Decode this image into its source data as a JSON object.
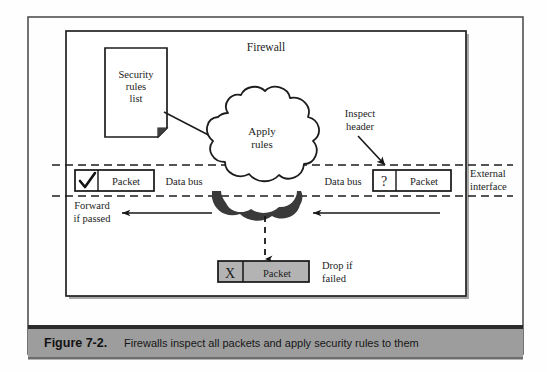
{
  "figure": {
    "number": "Figure 7-2.",
    "caption": "Firewalls inspect all packets and apply security rules to them",
    "caption_bar_color": "#9d9d9d",
    "caption_bar_top_rule_color": "#2b2b2b"
  },
  "diagram": {
    "outer_frame_color": "#4a4a4a",
    "inner_box_label": "Firewall",
    "inner_box_border_color": "#2a2a2a",
    "inner_box_shadow_color": "#8f8f8f",
    "background": "#ffffff",
    "doc": {
      "lines": [
        "Security",
        "rules",
        "list"
      ],
      "fill": "#ffffff",
      "stroke": "#1d1d1d",
      "fold_fill": "#4d4d4d"
    },
    "cloud": {
      "lines": [
        "Apply",
        "rules"
      ],
      "fill": "#ffffff",
      "stroke": "#1d1d1d",
      "shadow_color": "#3a3a3a"
    },
    "labels": {
      "data_bus_left": "Data bus",
      "data_bus_right": "Data bus",
      "external_interface_line1": "External",
      "external_interface_line2": "interface",
      "inspect_header_line1": "Inspect",
      "inspect_header_line2": "header",
      "forward_line1": "Forward",
      "forward_line2": "if passed",
      "drop_line1": "Drop if",
      "drop_line2": "failed"
    },
    "packets": {
      "passed": {
        "marker": "check",
        "marker_glyph": "✔",
        "label": "Packet",
        "fill": "#ffffff",
        "stroke": "#151515"
      },
      "inspected": {
        "marker": "question",
        "marker_glyph": "?",
        "label": "Packet",
        "fill": "#ffffff",
        "stroke": "#151515"
      },
      "dropped": {
        "marker": "x",
        "marker_glyph": "X",
        "label": "Packet",
        "fill": "#b3b3b3",
        "stroke": "#151515"
      }
    },
    "interface_boundary": {
      "style": "dashed",
      "color": "#1c1c1c",
      "top_y": 165,
      "bottom_y": 196
    },
    "flow_arrows": [
      {
        "name": "inbound-arrow",
        "from_x": 437,
        "to_x": 313,
        "y": 213,
        "direction": "left"
      },
      {
        "name": "forward-arrow",
        "from_x": 210,
        "to_x": 121,
        "y": 213,
        "direction": "left"
      },
      {
        "name": "drop-arrow",
        "x": 265,
        "from_y": 205,
        "to_y": 258,
        "direction": "down",
        "style": "dashed"
      },
      {
        "name": "inspect-header-arrow",
        "from_x": 355,
        "from_y": 125,
        "to_x": 385,
        "to_y": 166,
        "direction": "down-right"
      }
    ]
  }
}
